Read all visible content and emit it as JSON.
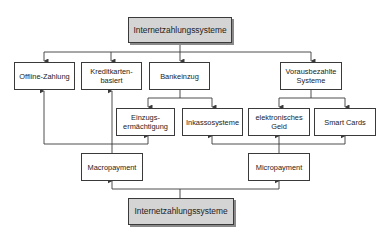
{
  "diagram": {
    "top_root": {
      "label": "Internetzahlungssysteme"
    },
    "bottom_root": {
      "label": "Internetzahlungssysteme"
    },
    "categories": [
      {
        "id": "offline",
        "label": "Offline-Zahlung"
      },
      {
        "id": "kredit",
        "label": "Kreditkarten-\nbasiert"
      },
      {
        "id": "bank",
        "label": "Bankeinzug"
      },
      {
        "id": "voraus",
        "label": "Vorausbezahlte\nSysteme"
      }
    ],
    "subcategories": [
      {
        "id": "einzug",
        "label": "Einzugs-\nermächtigung",
        "parent": "bank"
      },
      {
        "id": "inkasso",
        "label": "Inkassosysteme",
        "parent": "bank"
      },
      {
        "id": "egeld",
        "label": "elektronisches\nGeld",
        "parent": "voraus"
      },
      {
        "id": "smart",
        "label": "Smart Cards",
        "parent": "voraus"
      }
    ],
    "payment_types": [
      {
        "id": "macro",
        "label": "Macropayment",
        "targets": [
          "offline",
          "kredit",
          "einzug"
        ]
      },
      {
        "id": "micro",
        "label": "Micropayment",
        "targets": [
          "inkasso",
          "egeld",
          "smart"
        ]
      }
    ],
    "line_color": "#3a3a3a",
    "root_fill": "#d4d4d4"
  }
}
